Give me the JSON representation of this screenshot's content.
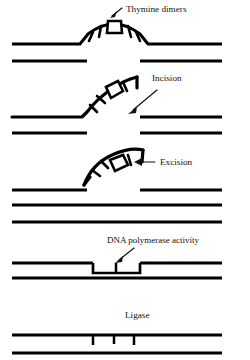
{
  "figure": {
    "background_color": "#ffffff",
    "ink_color": "#000000",
    "width": 250,
    "height": 360
  },
  "labels": {
    "thymine_dimers": "Thymine dimers",
    "incision": "Incision",
    "excision": "Excision",
    "dna_polymerase": "DNA polymerase activity",
    "ligase": "Ligase"
  },
  "stages": [
    {
      "id": "stage-thymine-dimers",
      "index": 1,
      "label": "Thymine dimers",
      "description": "Damaged strand bulges upward carrying a thymine dimer"
    },
    {
      "id": "stage-incision",
      "index": 2,
      "label": "Incision",
      "description": "Damaged strand is cut and lifted free at one end"
    },
    {
      "id": "stage-excision",
      "index": 3,
      "label": "Excision",
      "description": "Dimer-containing fragment is removed entirely"
    },
    {
      "id": "stage-dna-polymerase",
      "index": 4,
      "label": "DNA polymerase activity",
      "description": "New nucleotides fill the gap in the strand"
    },
    {
      "id": "stage-ligase",
      "index": 5,
      "label": "Ligase",
      "description": "Remaining nicks are sealed to restore a continuous strand"
    }
  ],
  "icons": {
    "arrow_down_left": "arrow-pointer-icon",
    "arrow_left": "arrow-left-icon",
    "dimer": "thymine-dimer-icon"
  }
}
